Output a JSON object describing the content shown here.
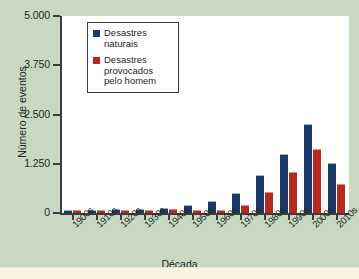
{
  "chart_data": {
    "type": "bar",
    "title": "",
    "xlabel": "Década",
    "ylabel": "Número de eventos",
    "categories": [
      "1900s",
      "1910s",
      "1920s",
      "1930s",
      "1940s",
      "1950s",
      "1960s",
      "1970s",
      "1980s",
      "1990s",
      "2000s",
      "2010s"
    ],
    "series": [
      {
        "name": "Desastres naturais",
        "color": "#1b3a69",
        "values": [
          60,
          55,
          75,
          70,
          100,
          190,
          290,
          470,
          930,
          1470,
          2245,
          1240
        ]
      },
      {
        "name": "Desastres provocados pelo homem",
        "color": "#b52a1e",
        "values": [
          10,
          25,
          8,
          50,
          65,
          45,
          60,
          180,
          500,
          1010,
          1590,
          720
        ]
      }
    ],
    "ylim": [
      0,
      5000
    ],
    "yticks": [
      0,
      1250,
      2500,
      3750,
      5000
    ],
    "ytick_labels": [
      "0",
      "1.250",
      "2.500",
      "3.750",
      "5.000"
    ],
    "grid": false,
    "legend_position": "top-left-inside"
  },
  "axes": {
    "y_title": "Número de eventos",
    "x_title": "Década",
    "y_ticks": [
      {
        "label": "5.000",
        "value": 5000
      },
      {
        "label": "3.750",
        "value": 3750
      },
      {
        "label": "2.500",
        "value": 2500
      },
      {
        "label": "1.250",
        "value": 1250
      },
      {
        "label": "0",
        "value": 0
      }
    ],
    "x_ticks": [
      "1900s",
      "1910s",
      "1920s",
      "1930s",
      "1940s",
      "1950s",
      "1960s",
      "1970s",
      "1980s",
      "1990s",
      "2000s",
      "2010s"
    ]
  },
  "legend": {
    "items": [
      {
        "label": "Desastres naturais",
        "color": "#1b3a69"
      },
      {
        "label": "Desastres provocados pelo homem",
        "color": "#b52a1e"
      }
    ]
  },
  "colors": {
    "background": "#c9d8c1",
    "plot_background": "#ffffff",
    "axis": "#3a3f39",
    "natural": "#1b3a69",
    "manmade": "#b52a1e",
    "bottom_strip": "#fbf4e2"
  }
}
